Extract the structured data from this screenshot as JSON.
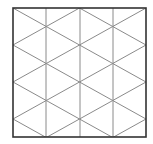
{
  "diagram": {
    "type": "isometric-triangular-grid",
    "square": {
      "x": 13,
      "y": 8,
      "width": 133,
      "height": 129
    },
    "columns": 4,
    "vertical_line_xs": [
      46,
      80,
      113
    ],
    "colors": {
      "border": "#333333",
      "grid": "#8a8a8a",
      "background": "#ffffff"
    }
  }
}
